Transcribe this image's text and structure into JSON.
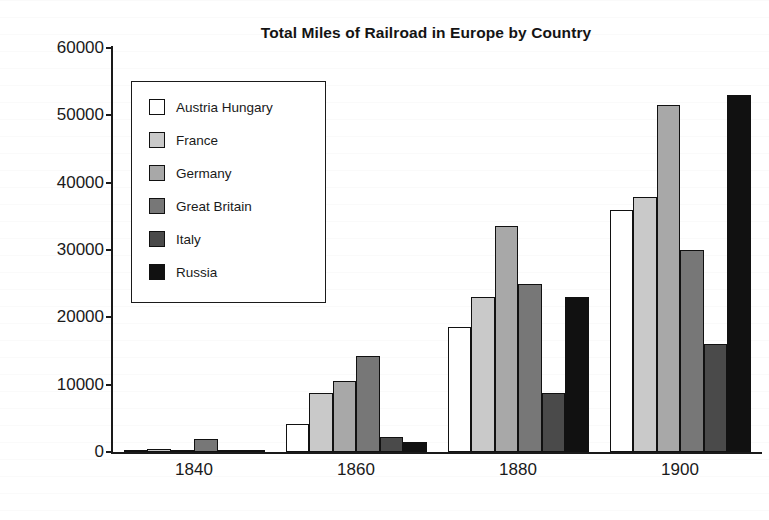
{
  "chart_data": {
    "type": "bar",
    "title": "Total Miles of Railroad in Europe by Country",
    "xlabel": "",
    "ylabel": "",
    "categories": [
      "1840",
      "1860",
      "1880",
      "1900"
    ],
    "ylim": [
      0,
      60000
    ],
    "yticks": [
      0,
      10000,
      20000,
      30000,
      40000,
      50000,
      60000
    ],
    "ytick_labels": [
      "0",
      "10000",
      "20000",
      "30000",
      "40000",
      "50000",
      "60000"
    ],
    "grid": false,
    "legend_position": "upper-left-inside",
    "series": [
      {
        "name": "Austria Hungary",
        "color": "#ffffff",
        "values": [
          200,
          4200,
          18500,
          36000
        ]
      },
      {
        "name": "France",
        "color": "#c9c9c9",
        "values": [
          500,
          8800,
          23000,
          37800
        ]
      },
      {
        "name": "Germany",
        "color": "#a8a8a8",
        "values": [
          300,
          10500,
          33500,
          51500
        ]
      },
      {
        "name": "Great Britain",
        "color": "#777777",
        "values": [
          2000,
          14300,
          25000,
          30000
        ]
      },
      {
        "name": "Italy",
        "color": "#4a4a4a",
        "values": [
          150,
          2300,
          8800,
          16000
        ]
      },
      {
        "name": "Russia",
        "color": "#111111",
        "values": [
          200,
          1500,
          23000,
          53000
        ]
      }
    ]
  },
  "legend": {
    "items": [
      {
        "label": "Austria Hungary"
      },
      {
        "label": "France"
      },
      {
        "label": "Germany"
      },
      {
        "label": "Great Britain"
      },
      {
        "label": "Italy"
      },
      {
        "label": "Russia"
      }
    ]
  },
  "axes": {
    "y_tick_labels": [
      "60000",
      "50000",
      "40000",
      "30000",
      "20000",
      "10000",
      "0"
    ],
    "x_tick_labels": [
      "1840",
      "1860",
      "1880",
      "1900"
    ]
  }
}
